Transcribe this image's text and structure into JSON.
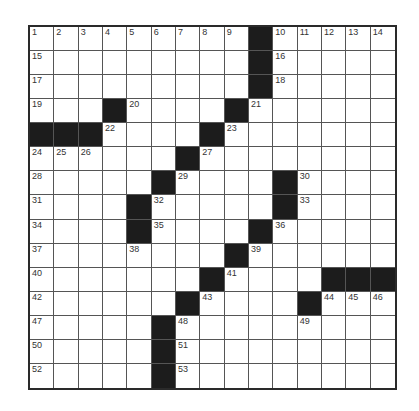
{
  "puzzle": {
    "rows": 15,
    "cols": 15,
    "colors": {
      "block": "#1c1c1c",
      "cell": "#ffffff",
      "border": "#2a2a2a",
      "gridline": "#555555"
    },
    "blocks": [
      [
        0,
        9
      ],
      [
        1,
        9
      ],
      [
        2,
        9
      ],
      [
        3,
        3
      ],
      [
        3,
        8
      ],
      [
        4,
        0
      ],
      [
        4,
        1
      ],
      [
        4,
        2
      ],
      [
        4,
        7
      ],
      [
        5,
        6
      ],
      [
        6,
        5
      ],
      [
        6,
        10
      ],
      [
        7,
        4
      ],
      [
        7,
        10
      ],
      [
        8,
        4
      ],
      [
        8,
        9
      ],
      [
        9,
        8
      ],
      [
        10,
        7
      ],
      [
        10,
        12
      ],
      [
        10,
        13
      ],
      [
        10,
        14
      ],
      [
        11,
        6
      ],
      [
        11,
        11
      ],
      [
        12,
        5
      ],
      [
        13,
        5
      ],
      [
        14,
        5
      ]
    ],
    "numbers": [
      {
        "r": 0,
        "c": 0,
        "n": "1"
      },
      {
        "r": 0,
        "c": 1,
        "n": "2"
      },
      {
        "r": 0,
        "c": 2,
        "n": "3"
      },
      {
        "r": 0,
        "c": 3,
        "n": "4"
      },
      {
        "r": 0,
        "c": 4,
        "n": "5"
      },
      {
        "r": 0,
        "c": 5,
        "n": "6"
      },
      {
        "r": 0,
        "c": 6,
        "n": "7"
      },
      {
        "r": 0,
        "c": 7,
        "n": "8"
      },
      {
        "r": 0,
        "c": 8,
        "n": "9"
      },
      {
        "r": 0,
        "c": 10,
        "n": "10"
      },
      {
        "r": 0,
        "c": 11,
        "n": "11"
      },
      {
        "r": 0,
        "c": 12,
        "n": "12"
      },
      {
        "r": 0,
        "c": 13,
        "n": "13"
      },
      {
        "r": 0,
        "c": 14,
        "n": "14"
      },
      {
        "r": 1,
        "c": 0,
        "n": "15"
      },
      {
        "r": 1,
        "c": 10,
        "n": "16"
      },
      {
        "r": 2,
        "c": 0,
        "n": "17"
      },
      {
        "r": 2,
        "c": 10,
        "n": "18"
      },
      {
        "r": 3,
        "c": 0,
        "n": "19"
      },
      {
        "r": 3,
        "c": 4,
        "n": "20"
      },
      {
        "r": 3,
        "c": 9,
        "n": "21"
      },
      {
        "r": 4,
        "c": 3,
        "n": "22"
      },
      {
        "r": 4,
        "c": 8,
        "n": "23"
      },
      {
        "r": 5,
        "c": 0,
        "n": "24"
      },
      {
        "r": 5,
        "c": 1,
        "n": "25"
      },
      {
        "r": 5,
        "c": 2,
        "n": "26"
      },
      {
        "r": 5,
        "c": 7,
        "n": "27"
      },
      {
        "r": 6,
        "c": 0,
        "n": "28"
      },
      {
        "r": 6,
        "c": 6,
        "n": "29"
      },
      {
        "r": 6,
        "c": 11,
        "n": "30"
      },
      {
        "r": 7,
        "c": 0,
        "n": "31"
      },
      {
        "r": 7,
        "c": 5,
        "n": "32"
      },
      {
        "r": 7,
        "c": 11,
        "n": "33"
      },
      {
        "r": 8,
        "c": 0,
        "n": "34"
      },
      {
        "r": 8,
        "c": 5,
        "n": "35"
      },
      {
        "r": 8,
        "c": 10,
        "n": "36"
      },
      {
        "r": 9,
        "c": 0,
        "n": "37"
      },
      {
        "r": 9,
        "c": 4,
        "n": "38"
      },
      {
        "r": 9,
        "c": 9,
        "n": "39"
      },
      {
        "r": 10,
        "c": 0,
        "n": "40"
      },
      {
        "r": 10,
        "c": 8,
        "n": "41"
      },
      {
        "r": 11,
        "c": 0,
        "n": "42"
      },
      {
        "r": 11,
        "c": 7,
        "n": "43"
      },
      {
        "r": 11,
        "c": 12,
        "n": "44"
      },
      {
        "r": 11,
        "c": 13,
        "n": "45"
      },
      {
        "r": 11,
        "c": 14,
        "n": "46"
      },
      {
        "r": 12,
        "c": 0,
        "n": "47"
      },
      {
        "r": 12,
        "c": 6,
        "n": "48"
      },
      {
        "r": 12,
        "c": 11,
        "n": "49"
      },
      {
        "r": 13,
        "c": 0,
        "n": "50"
      },
      {
        "r": 13,
        "c": 6,
        "n": "51"
      },
      {
        "r": 14,
        "c": 0,
        "n": "52"
      },
      {
        "r": 14,
        "c": 6,
        "n": "53"
      }
    ]
  }
}
